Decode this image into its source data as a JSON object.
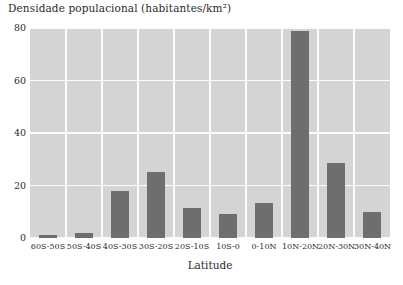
{
  "chart_data": {
    "type": "bar",
    "title": "Densidade populacional (habitantes/km²)",
    "xlabel": "Latitude",
    "ylabel": "",
    "categories": [
      "60S-50S",
      "50S-40S",
      "40S-30S",
      "30S-20S",
      "20S-10S",
      "10S-0",
      "0-10N",
      "10N-20N",
      "20N-30N",
      "30N-40N"
    ],
    "values": [
      1,
      2,
      18,
      25,
      11.5,
      9,
      13.5,
      79,
      28.5,
      10
    ],
    "ylim": [
      0,
      80
    ],
    "yticks": [
      0,
      20,
      40,
      60,
      80
    ],
    "ytick_labels": [
      "0",
      "20",
      "40",
      "60",
      "80"
    ],
    "grid": true,
    "legend": "none",
    "bar_color": "#6e6e6e",
    "plot_background": "#d4d4d4",
    "gridline_color": "#fcfcfc"
  }
}
